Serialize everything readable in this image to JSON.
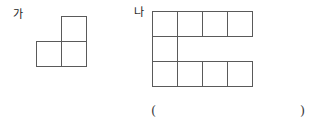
{
  "page": {
    "background_color": "#ffffff",
    "line_color": "#5a5a5a",
    "text_color": "#1c1c1c"
  },
  "figures": [
    {
      "id": "ga",
      "label": "가",
      "shape_name": "l-tromino",
      "cell_count": 3,
      "grid_columns": 2,
      "grid_rows": 2,
      "cells": [
        {
          "row": 0,
          "col": 1
        },
        {
          "row": 1,
          "col": 0
        },
        {
          "row": 1,
          "col": 1
        }
      ]
    },
    {
      "id": "na",
      "label": "나",
      "shape_name": "c-shape-decomino",
      "cell_count": 9,
      "grid_columns": 4,
      "grid_rows": 3,
      "cells": [
        {
          "row": 0,
          "col": 0
        },
        {
          "row": 0,
          "col": 1
        },
        {
          "row": 0,
          "col": 2
        },
        {
          "row": 0,
          "col": 3
        },
        {
          "row": 1,
          "col": 0
        },
        {
          "row": 2,
          "col": 0
        },
        {
          "row": 2,
          "col": 1
        },
        {
          "row": 2,
          "col": 2
        },
        {
          "row": 2,
          "col": 3
        }
      ]
    }
  ],
  "answer_blank": {
    "open_paren": "(",
    "close_paren": ")",
    "value": ""
  }
}
